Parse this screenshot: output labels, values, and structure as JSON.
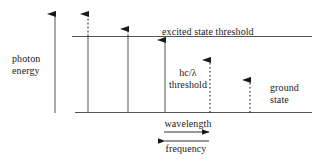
{
  "figure": {
    "type": "energy-level-diagram",
    "title": "",
    "axes": {
      "vertical_axis_label": "photon\nenergy",
      "vertical_axis_label_lines": [
        "photon",
        "energy"
      ],
      "vertical_axis_direction": "up",
      "horizontal_scale_labels": [
        {
          "text": "wavelength",
          "arrow_direction": "right"
        },
        {
          "text": "frequency",
          "arrow_direction": "left"
        }
      ]
    },
    "levels": [
      {
        "name": "excited-state-threshold",
        "label": "excited state threshold",
        "y": 36
      },
      {
        "name": "ground-state",
        "label": "ground state",
        "label_lines": [
          "ground",
          "state"
        ],
        "y": 112
      }
    ],
    "annotations": [
      {
        "name": "hc-lambda-threshold",
        "lines": [
          "hc/λ",
          "threshold"
        ]
      }
    ],
    "transitions": [
      {
        "id": 1,
        "x": 88,
        "style": "solid-with-dashed-extension",
        "tip_y": 10,
        "solid_top_y": 36,
        "reaches_threshold": true
      },
      {
        "id": 2,
        "x": 128,
        "style": "solid-with-dashed-extension",
        "tip_y": 25,
        "solid_top_y": 36,
        "reaches_threshold": true
      },
      {
        "id": 3,
        "x": 165,
        "style": "solid",
        "tip_y": 36,
        "solid_top_y": 36,
        "reaches_threshold": true
      },
      {
        "id": 4,
        "x": 210,
        "style": "dotted",
        "tip_y": 56,
        "reaches_threshold": false
      },
      {
        "id": 5,
        "x": 250,
        "style": "dotted",
        "tip_y": 76,
        "reaches_threshold": false
      }
    ],
    "colors": {
      "ink": "#1a1a1a",
      "line": "#555555",
      "background": "#ffffff"
    }
  }
}
